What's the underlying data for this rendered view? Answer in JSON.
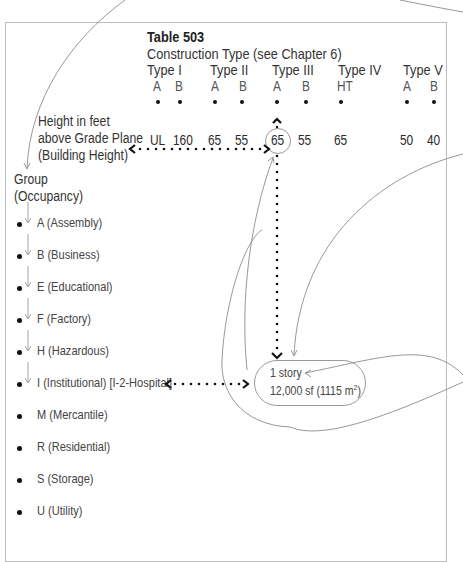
{
  "table": {
    "title": "Table 503",
    "subtitle": "Construction Type (see Chapter 6)",
    "types": [
      {
        "label": "Type I",
        "subtypes": [
          "A",
          "B"
        ],
        "heights": [
          "UL",
          "160"
        ]
      },
      {
        "label": "Type II",
        "subtypes": [
          "A",
          "B"
        ],
        "heights": [
          "65",
          "55"
        ]
      },
      {
        "label": "Type III",
        "subtypes": [
          "A",
          "B"
        ],
        "heights": [
          "65",
          "55"
        ]
      },
      {
        "label": "Type IV",
        "subtypes": [
          "HT"
        ],
        "heights": [
          "65"
        ]
      },
      {
        "label": "Type V",
        "subtypes": [
          "A",
          "B"
        ],
        "heights": [
          "50",
          "40"
        ]
      }
    ],
    "height_label": {
      "line1": "Height in feet",
      "line2": "above Grade Plane",
      "line3": "(Building Height)"
    },
    "highlighted_value": "65"
  },
  "groups": {
    "heading_line1": "Group",
    "heading_line2": "(Occupancy)",
    "items": [
      "A (Assembly)",
      "B (Business)",
      "E (Educational)",
      "F (Factory)",
      "H (Hazardous)",
      "I (Institutional) [I-2-Hospital]",
      "M (Mercantile)",
      "R (Residential)",
      "S (Storage)",
      "U (Utility)"
    ]
  },
  "result": {
    "line1": "1 story",
    "line2_prefix": "12,000 sf (1115 m",
    "line2_sup": "2",
    "line2_suffix": ")"
  },
  "colors": {
    "frame": "#bdbdbd",
    "annotation_curve": "#8c8c8c",
    "dotted_arrow": "#111111",
    "text": "#2a2a2a"
  }
}
